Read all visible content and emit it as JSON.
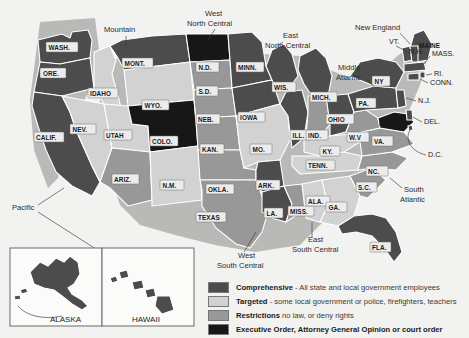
{
  "map": {
    "title_present": false,
    "background_color": "#f2f2f0",
    "category_colors": {
      "comprehensive": "#4c4c4c",
      "targeted": "#d2d2d2",
      "restrictions": "#989898",
      "executive_order": "#171717"
    },
    "states": [
      {
        "id": "WA",
        "label": "WASH.",
        "category": "comprehensive"
      },
      {
        "id": "OR",
        "label": "ORE.",
        "category": "comprehensive"
      },
      {
        "id": "CA",
        "label": "CALIF.",
        "category": "comprehensive"
      },
      {
        "id": "NV",
        "label": "NEV.",
        "category": "targeted"
      },
      {
        "id": "ID",
        "label": "IDAHO",
        "category": "targeted"
      },
      {
        "id": "MT",
        "label": "MONT.",
        "category": "comprehensive"
      },
      {
        "id": "WY",
        "label": "WYO.",
        "category": "targeted"
      },
      {
        "id": "UT",
        "label": "UTAH",
        "category": "targeted"
      },
      {
        "id": "CO",
        "label": "COLO.",
        "category": "executive_order"
      },
      {
        "id": "AZ",
        "label": "ARIZ.",
        "category": "restrictions"
      },
      {
        "id": "NM",
        "label": "N.M.",
        "category": "targeted"
      },
      {
        "id": "ND",
        "label": "N.D.",
        "category": "executive_order"
      },
      {
        "id": "SD",
        "label": "S.D.",
        "category": "restrictions"
      },
      {
        "id": "NE",
        "label": "NEB.",
        "category": "restrictions"
      },
      {
        "id": "KS",
        "label": "KAN.",
        "category": "restrictions"
      },
      {
        "id": "OK",
        "label": "OKLA.",
        "category": "restrictions"
      },
      {
        "id": "TX",
        "label": "TEXAS",
        "category": "restrictions"
      },
      {
        "id": "MN",
        "label": "MINN.",
        "category": "comprehensive"
      },
      {
        "id": "IA",
        "label": "IOWA",
        "category": "comprehensive"
      },
      {
        "id": "MO",
        "label": "MO.",
        "category": "targeted"
      },
      {
        "id": "AR",
        "label": "ARK.",
        "category": "comprehensive"
      },
      {
        "id": "LA",
        "label": "LA.",
        "category": "comprehensive"
      },
      {
        "id": "WI",
        "label": "WIS.",
        "category": "comprehensive"
      },
      {
        "id": "IL",
        "label": "ILL.",
        "category": "comprehensive"
      },
      {
        "id": "MS",
        "label": "MISS.",
        "category": "restrictions"
      },
      {
        "id": "MI",
        "label": "MICH.",
        "category": "comprehensive"
      },
      {
        "id": "IN",
        "label": "IND.",
        "category": "restrictions"
      },
      {
        "id": "OH",
        "label": "OHIO",
        "category": "comprehensive"
      },
      {
        "id": "KY",
        "label": "KY.",
        "category": "targeted"
      },
      {
        "id": "TN",
        "label": "TENN.",
        "category": "targeted"
      },
      {
        "id": "AL",
        "label": "ALA.",
        "category": "targeted"
      },
      {
        "id": "GA",
        "label": "GA.",
        "category": "targeted"
      },
      {
        "id": "FL",
        "label": "FLA.",
        "category": "comprehensive"
      },
      {
        "id": "SC",
        "label": "S.C.",
        "category": "restrictions"
      },
      {
        "id": "NC",
        "label": "NC.",
        "category": "restrictions"
      },
      {
        "id": "VA",
        "label": "VA.",
        "category": "restrictions"
      },
      {
        "id": "WV",
        "label": "W.V",
        "category": "restrictions"
      },
      {
        "id": "MD",
        "label": "MD.",
        "category": "executive_order"
      },
      {
        "id": "PA",
        "label": "PA.",
        "category": "comprehensive"
      },
      {
        "id": "NY",
        "label": "NY",
        "category": "comprehensive"
      },
      {
        "id": "ME",
        "label": "MAINE",
        "category": "comprehensive"
      },
      {
        "id": "AK",
        "label": "ALASKA",
        "category": "comprehensive"
      },
      {
        "id": "HI",
        "label": "HAWAII",
        "category": "comprehensive"
      }
    ],
    "callouts": [
      {
        "id": "VT",
        "label": "VT.",
        "category": "comprehensive"
      },
      {
        "id": "NH",
        "label": "N.H.",
        "category": "comprehensive"
      },
      {
        "id": "MA",
        "label": "MASS.",
        "category": "comprehensive"
      },
      {
        "id": "RI",
        "label": "RI.",
        "category": "comprehensive"
      },
      {
        "id": "CT",
        "label": "CONN.",
        "category": "comprehensive"
      },
      {
        "id": "NJ",
        "label": "N.J.",
        "category": "comprehensive"
      },
      {
        "id": "DE",
        "label": "DEL.",
        "category": "comprehensive"
      },
      {
        "id": "DC",
        "label": "D.C.",
        "category": "comprehensive"
      }
    ],
    "regions": [
      {
        "id": "mountain",
        "label": "Mountain"
      },
      {
        "id": "west-north-central",
        "label": "West\nNorth Central",
        "line1": "West",
        "line2": "North Central"
      },
      {
        "id": "east-north-central",
        "label": "East\nNorth Central",
        "line1": "East",
        "line2": "North Central"
      },
      {
        "id": "new-england",
        "label": "New England"
      },
      {
        "id": "middle-atlantic",
        "label": "Middle\nAtlantic",
        "line1": "Middle",
        "line2": "Atlantic"
      },
      {
        "id": "south-atlantic",
        "label": "South\nAtlantic",
        "line1": "South",
        "line2": "Atlantic"
      },
      {
        "id": "pacific",
        "label": "Pacific"
      },
      {
        "id": "west-south-central",
        "label": "West\nSouth Central",
        "line1": "West",
        "line2": "South Central"
      },
      {
        "id": "east-south-central",
        "label": "East\nSouth Central",
        "line1": "East",
        "line2": "South Central"
      }
    ],
    "inset": {
      "alaska_label": "ALASKA",
      "hawaii_label": "HAWAII"
    }
  },
  "legend": {
    "items": [
      {
        "key": "comprehensive",
        "swatch": "comp",
        "term": "Comprehensive",
        "desc": " - All state and local government employees"
      },
      {
        "key": "targeted",
        "swatch": "targ",
        "term": "Targeted",
        "desc": " - some local government or police, firefighters, teachers"
      },
      {
        "key": "restrictions",
        "swatch": "rest",
        "term": "Restrictions",
        "desc": " no law, or deny rights"
      },
      {
        "key": "executive_order",
        "swatch": "exec",
        "term": "Executive Order, Attorney General Opinion or court order",
        "desc": ""
      }
    ]
  }
}
